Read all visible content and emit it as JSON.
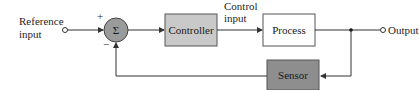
{
  "diagram": {
    "type": "feedback-control-block-diagram",
    "reference_input": {
      "line1": "Reference",
      "line2": "input"
    },
    "summing_junction": {
      "symbol": "Σ",
      "plus_sign": "+",
      "minus_sign": "−"
    },
    "controller": {
      "label": "Controller"
    },
    "control_input": {
      "line1": "Control",
      "line2": "input"
    },
    "process": {
      "label": "Process"
    },
    "output": {
      "label": "Output"
    },
    "sensor": {
      "label": "Sensor"
    },
    "colors": {
      "summing_fill": "#9b9b9b",
      "controller_fill": "#c9c9c9",
      "process_fill": "#ffffff",
      "sensor_fill": "#8e8e8e",
      "line": "#333333"
    }
  }
}
